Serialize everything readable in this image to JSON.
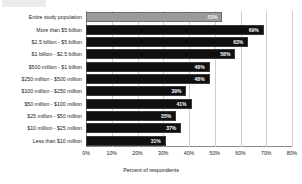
{
  "chart_data": {
    "type": "bar",
    "orientation": "horizontal",
    "title": "",
    "subtitle": "",
    "xlabel": "Percent of respondents",
    "ylabel": "",
    "xlim": [
      0,
      80
    ],
    "xtick_labels": [
      "0%",
      "10%",
      "20%",
      "30%",
      "40%",
      "50%",
      "60%",
      "70%",
      "80%"
    ],
    "xtick_values": [
      0,
      10,
      20,
      30,
      40,
      50,
      60,
      70,
      80
    ],
    "grid": true,
    "legend": "none",
    "value_label_suffix": "%",
    "categories": [
      "Entire study population",
      "More than $5 billion",
      "$2.5 billion - $5 billion",
      "$1 billion - $2.5 billion",
      "$500 million - $1 billion",
      "$250 million - $500 million",
      "$100 million - $250 million",
      "$50 million - $100 million",
      "$25 million - $50 million",
      "$10 million - $25 million",
      "Less than $10 million"
    ],
    "values": [
      53,
      69,
      63,
      58,
      48,
      48,
      39,
      41,
      35,
      37,
      31
    ],
    "value_labels": [
      "53%",
      "69%",
      "63%",
      "58%",
      "48%",
      "48%",
      "39%",
      "41%",
      "35%",
      "37%",
      "31%"
    ],
    "highlight_index": 0,
    "colors": {
      "bar": "#101010",
      "bar_highlight": "#9a9a9a",
      "grid": "#cfcfcf",
      "axis": "#8a8a8a",
      "background": "#ffffff",
      "value_text": "#ffffff",
      "label_text": "#1a1a1a"
    }
  }
}
